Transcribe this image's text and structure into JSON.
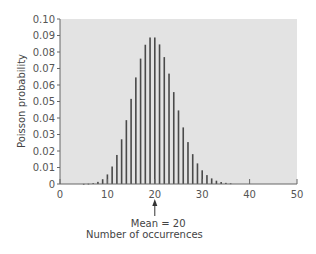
{
  "chart_data": {
    "type": "bar",
    "title": "",
    "xlabel": "Number of occurrences",
    "ylabel": "Poisson probability",
    "xlim": [
      0,
      50
    ],
    "ylim": [
      0,
      0.1
    ],
    "xticks": [
      0,
      10,
      20,
      30,
      40,
      50
    ],
    "yticks": [
      "0",
      "0.01",
      "0.02",
      "0.03",
      "0.04",
      "0.05",
      "0.06",
      "0.07",
      "0.08",
      "0.09",
      "0.10"
    ],
    "grid": false,
    "legend": null,
    "annotation": {
      "text": "Mean = 20",
      "x": 20
    },
    "x": [
      5,
      6,
      7,
      8,
      9,
      10,
      11,
      12,
      13,
      14,
      15,
      16,
      17,
      18,
      19,
      20,
      21,
      22,
      23,
      24,
      25,
      26,
      27,
      28,
      29,
      30,
      31,
      32,
      33,
      34,
      35,
      36
    ],
    "values": [
      0.0001,
      0.0002,
      0.0005,
      0.0013,
      0.0029,
      0.0058,
      0.0106,
      0.0176,
      0.0271,
      0.0387,
      0.0516,
      0.0646,
      0.076,
      0.0844,
      0.0888,
      0.0888,
      0.0846,
      0.0769,
      0.0669,
      0.0557,
      0.0446,
      0.0343,
      0.0254,
      0.0181,
      0.0125,
      0.0083,
      0.0054,
      0.0034,
      0.002,
      0.0012,
      0.0007,
      0.0004
    ],
    "colors": {
      "plot_background": "#e3e3e3",
      "bar": "#4a4a4a",
      "axis": "#666666"
    }
  }
}
